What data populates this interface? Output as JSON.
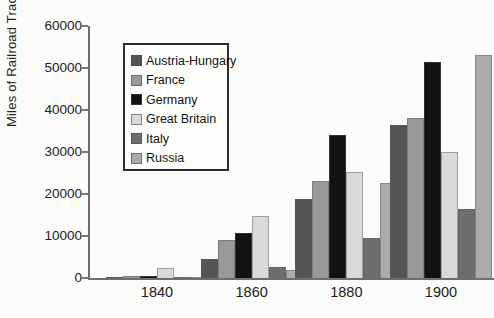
{
  "figure": {
    "background": "#fbfbfa",
    "axis_color": "#6e6e6e",
    "text_color": "#1e1e1e"
  },
  "chart_data": {
    "type": "bar",
    "title": "",
    "xlabel": "",
    "ylabel": "Miles of Railroad Track",
    "ylim": [
      0,
      60000
    ],
    "ytick_step": 10000,
    "yticks": [
      "0",
      "10000",
      "20000",
      "30000",
      "40000",
      "50000",
      "60000"
    ],
    "grid": false,
    "legend_position": "upper-left-inside",
    "categories": [
      "1840",
      "1860",
      "1880",
      "1900"
    ],
    "series": [
      {
        "name": "Austria-Hungary",
        "color": "#555555",
        "values": [
          200,
          4500,
          18700,
          36500
        ]
      },
      {
        "name": "France",
        "color": "#999999",
        "values": [
          400,
          9000,
          23000,
          38000
        ]
      },
      {
        "name": "Germany",
        "color": "#121212",
        "values": [
          400,
          10700,
          34000,
          51500
        ]
      },
      {
        "name": "Great Britain",
        "color": "#d9d9d9",
        "values": [
          2400,
          14800,
          25300,
          30000
        ]
      },
      {
        "name": "Italy",
        "color": "#6e6e6e",
        "values": [
          100,
          2600,
          9500,
          16500
        ]
      },
      {
        "name": "Russia",
        "color": "#ababab",
        "values": [
          100,
          2000,
          22500,
          53000
        ]
      }
    ]
  }
}
